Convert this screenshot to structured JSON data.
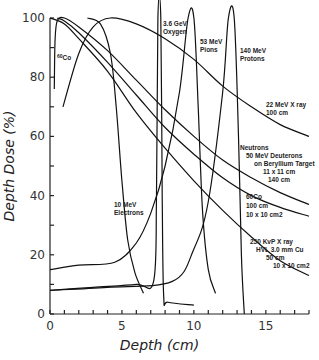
{
  "chart_data": {
    "type": "line",
    "title": "",
    "xlabel": "Depth (cm)",
    "ylabel": "Depth Dose (%)",
    "xlim": [
      0,
      18
    ],
    "ylim": [
      0,
      100
    ],
    "x_ticks": [
      0,
      5,
      10,
      15
    ],
    "y_ticks": [
      0,
      20,
      40,
      60,
      80,
      100
    ],
    "grid": false,
    "legend": "none",
    "series": [
      {
        "name": "22 MeV X ray 100 cm",
        "points": [
          [
            0.9,
            70
          ],
          [
            2,
            88
          ],
          [
            3,
            97
          ],
          [
            4.2,
            100
          ],
          [
            6,
            98
          ],
          [
            8,
            93
          ],
          [
            10,
            86
          ],
          [
            12,
            77
          ],
          [
            14,
            70
          ],
          [
            16,
            64
          ],
          [
            18,
            60
          ]
        ]
      },
      {
        "name": "Neutrons 50 MeV Deuterons on Beryllium Target 11 x 11 cm 140 cm",
        "points": [
          [
            0.3,
            76
          ],
          [
            0.35,
            92
          ],
          [
            0.5,
            99
          ],
          [
            1,
            100
          ],
          [
            2,
            97
          ],
          [
            4,
            89
          ],
          [
            6,
            79
          ],
          [
            8,
            69
          ],
          [
            10,
            60
          ],
          [
            12,
            52
          ],
          [
            14,
            46
          ],
          [
            16,
            41
          ],
          [
            18,
            37
          ]
        ]
      },
      {
        "name": "60Co 100 cm 10 x 10 cm2",
        "points": [
          [
            0.5,
            100
          ],
          [
            1,
            99
          ],
          [
            2,
            95
          ],
          [
            4,
            85
          ],
          [
            6,
            74
          ],
          [
            8,
            63
          ],
          [
            10,
            54
          ],
          [
            12,
            46
          ],
          [
            14,
            40
          ],
          [
            16,
            36
          ],
          [
            18,
            33
          ]
        ]
      },
      {
        "name": "250 KvP X ray HVL 3.0 mm Cu 50 cm 10 x 10 cm2",
        "points": [
          [
            0,
            100
          ],
          [
            1,
            98
          ],
          [
            2,
            93
          ],
          [
            4,
            82
          ],
          [
            6,
            68
          ],
          [
            8,
            56
          ],
          [
            10,
            45
          ],
          [
            12,
            35
          ],
          [
            14,
            26
          ],
          [
            16,
            18
          ],
          [
            18,
            13
          ]
        ]
      },
      {
        "name": "10 MeV Electrons",
        "points": [
          [
            2.6,
            100
          ],
          [
            3.5,
            98
          ],
          [
            4.2,
            88
          ],
          [
            4.6,
            70
          ],
          [
            5,
            45
          ],
          [
            5.4,
            25
          ],
          [
            5.9,
            14
          ],
          [
            6.5,
            7
          ]
        ]
      },
      {
        "name": "3.6 GeV Oxygen",
        "points": [
          [
            0,
            8
          ],
          [
            3,
            9
          ],
          [
            6,
            10
          ],
          [
            7.2,
            11
          ],
          [
            7.4,
            40
          ],
          [
            7.5,
            100
          ],
          [
            7.7,
            100
          ],
          [
            7.8,
            40
          ],
          [
            7.9,
            6
          ],
          [
            8.2,
            4
          ],
          [
            10,
            3
          ]
        ]
      },
      {
        "name": "53 MeV Pions",
        "points": [
          [
            0,
            15
          ],
          [
            2,
            16.5
          ],
          [
            4.5,
            17.5
          ],
          [
            6,
            24
          ],
          [
            7,
            34
          ],
          [
            8,
            50
          ],
          [
            9,
            75
          ],
          [
            9.6,
            100
          ],
          [
            10,
            100
          ],
          [
            10.3,
            70
          ],
          [
            10.6,
            35
          ],
          [
            11,
            15
          ],
          [
            11.5,
            7
          ]
        ]
      },
      {
        "name": "140 MeV Protons",
        "points": [
          [
            0,
            8
          ],
          [
            4,
            9
          ],
          [
            8.5,
            11
          ],
          [
            10,
            22
          ],
          [
            11,
            38
          ],
          [
            12,
            75
          ],
          [
            12.4,
            100
          ],
          [
            12.8,
            100
          ],
          [
            13.1,
            60
          ],
          [
            13.3,
            20
          ],
          [
            13.5,
            0
          ]
        ]
      }
    ],
    "annotations": [
      {
        "label_lines": [
          "60",
          "Co"
        ],
        "near": "left, below 100% near depth 0.5"
      },
      {
        "label_lines": [
          "3.6 GeV",
          "Oxygen"
        ]
      },
      {
        "label_lines": [
          "53 MeV",
          "Pions"
        ]
      },
      {
        "label_lines": [
          "140 MeV",
          "Protons"
        ]
      },
      {
        "label_lines": [
          "22 MeV X ray",
          "100 cm"
        ]
      },
      {
        "label_lines": [
          "Neutrons",
          "50 MeV Deuterons",
          "on Beryllium Target",
          "11 x 11 cm",
          "140 cm"
        ]
      },
      {
        "label_lines": [
          "60Co",
          "100 cm",
          "10 x 10 cm2"
        ]
      },
      {
        "label_lines": [
          "250 KvP X ray",
          "HVL 3.0 mm Cu",
          "50 cm",
          "10 x 10 cm2"
        ]
      },
      {
        "label_lines": [
          "10 MeV",
          "Electrons"
        ]
      }
    ]
  }
}
